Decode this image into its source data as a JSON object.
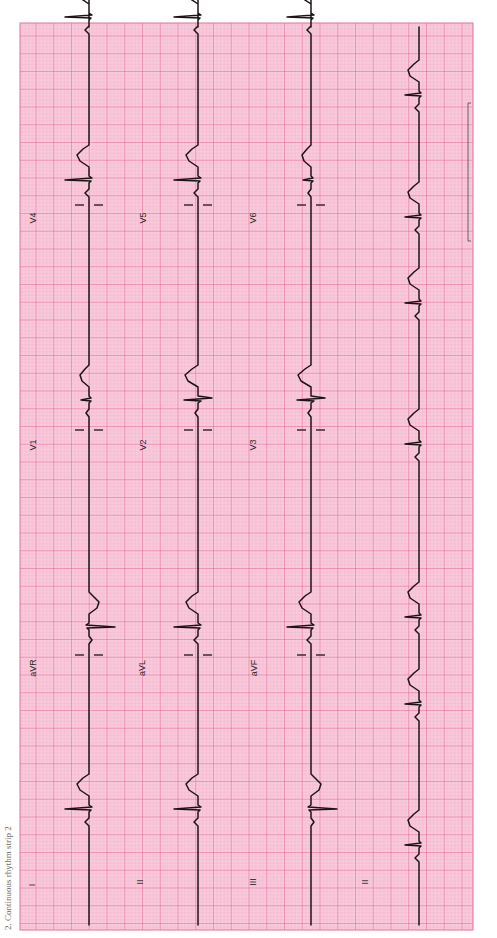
{
  "figure": {
    "caption": "2. Continuous rhythm strip 2",
    "orientation": "rotated-90-ccw",
    "paper": {
      "background": "#f8cadb",
      "minor_grid": "#f2a0c0",
      "major_grid": "#e2578c",
      "border": "#e4709a",
      "left": 20,
      "top": 23,
      "right": 473,
      "bottom": 930,
      "minor_px": 3.55,
      "major_every": 5
    },
    "trace_color": "#1c1414",
    "rows": [
      {
        "baseline_x": 89,
        "leads": [
          {
            "label": "I",
            "label_x": 35,
            "label_y": 885
          },
          {
            "label": "aVR",
            "label_x": 36,
            "label_y": 668
          },
          {
            "label": "V1",
            "label_x": 36,
            "label_y": 445
          },
          {
            "label": "V4",
            "label_x": 36,
            "label_y": 218
          }
        ]
      },
      {
        "baseline_x": 198,
        "leads": [
          {
            "label": "II",
            "label_x": 143,
            "label_y": 882
          },
          {
            "label": "aVL",
            "label_x": 145,
            "label_y": 668
          },
          {
            "label": "V2",
            "label_x": 146,
            "label_y": 445
          },
          {
            "label": "V5",
            "label_x": 146,
            "label_y": 218
          }
        ]
      },
      {
        "baseline_x": 311,
        "leads": [
          {
            "label": "III",
            "label_x": 256,
            "label_y": 882
          },
          {
            "label": "aVF",
            "label_x": 257,
            "label_y": 668
          },
          {
            "label": "V3",
            "label_x": 256,
            "label_y": 445
          },
          {
            "label": "V6",
            "label_x": 256,
            "label_y": 218
          }
        ]
      },
      {
        "baseline_x": 419,
        "leads": [
          {
            "label": "II",
            "label_x": 368,
            "label_y": 882
          }
        ]
      }
    ],
    "lead_dividers_y": [
      655,
      430,
      205
    ],
    "calibration_bracket": {
      "x": 468,
      "y1": 103,
      "y2": 241
    },
    "beats_y": [
      832,
      650,
      423,
      203,
      40
    ],
    "rhythm_beats_y": [
      868,
      727,
      640,
      467,
      326,
      240,
      118
    ]
  }
}
